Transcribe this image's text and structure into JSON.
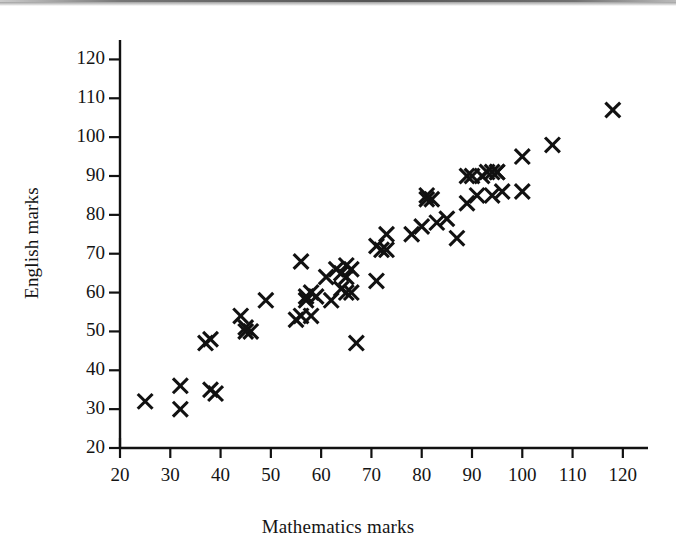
{
  "figure": {
    "kind": "scatter-plot",
    "background_color": "#ffffff",
    "ink_color": "#111111",
    "scan_artifact_color": "#8d8d8d"
  },
  "chart_data": {
    "type": "scatter",
    "title": "",
    "subtitle": "",
    "xlabel": "Mathematics marks",
    "ylabel": "English marks",
    "xlim": [
      20,
      125
    ],
    "ylim": [
      20,
      125
    ],
    "xticks": [
      20,
      30,
      40,
      50,
      60,
      70,
      80,
      90,
      100,
      110,
      120
    ],
    "xtick_labels": [
      "20",
      "30",
      "40",
      "50",
      "60",
      "70",
      "80",
      "90",
      "100",
      "110",
      "120"
    ],
    "yticks": [
      20,
      30,
      40,
      50,
      60,
      70,
      80,
      90,
      100,
      110,
      120
    ],
    "ytick_labels": [
      "20",
      "30",
      "40",
      "50",
      "60",
      "70",
      "80",
      "90",
      "100",
      "110",
      "120"
    ],
    "grid": false,
    "legend": null,
    "legend_position": "none",
    "marker": "x",
    "marker_color": "#111111",
    "annotations": [],
    "series": [
      {
        "name": "Students",
        "x": [
          25,
          32,
          32,
          38,
          39,
          37,
          38,
          44,
          45,
          46,
          45,
          49,
          55,
          56,
          56,
          57,
          57,
          58,
          58,
          59,
          61,
          62,
          63,
          64,
          64,
          65,
          65,
          65,
          66,
          66,
          67,
          71,
          71,
          72,
          73,
          73,
          78,
          80,
          81,
          81,
          82,
          83,
          85,
          87,
          89,
          89,
          90,
          91,
          92,
          93,
          94,
          94,
          95,
          95,
          96,
          100,
          100,
          106,
          118
        ],
        "y": [
          32,
          36,
          30,
          35,
          34,
          47,
          48,
          54,
          50,
          50,
          51,
          58,
          53,
          68,
          54,
          59,
          58,
          60,
          54,
          59,
          64,
          58,
          66,
          65,
          61,
          67,
          64,
          60,
          66,
          60,
          47,
          72,
          63,
          71,
          71,
          75,
          75,
          77,
          85,
          84,
          84,
          78,
          79,
          74,
          90,
          83,
          90,
          85,
          90,
          91,
          91,
          85,
          91,
          91,
          86,
          95,
          86,
          98,
          107
        ]
      }
    ]
  },
  "labels": {
    "x_axis_title": "Mathematics marks",
    "y_axis_title": "English marks"
  }
}
